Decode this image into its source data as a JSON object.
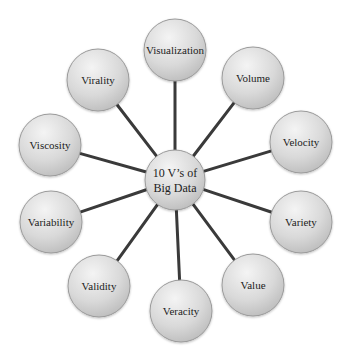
{
  "diagram": {
    "type": "hub-and-spoke",
    "hub": {
      "line1": "10 V’s of",
      "line2": "Big Data",
      "cx": 175,
      "cy": 180,
      "r": 30
    },
    "nodes": [
      {
        "id": "visualization",
        "label": "Visualization",
        "cx": 175,
        "cy": 50,
        "r": 31
      },
      {
        "id": "volume",
        "label": "Volume",
        "cx": 253,
        "cy": 78,
        "r": 31
      },
      {
        "id": "velocity",
        "label": "Velocity",
        "cx": 301,
        "cy": 142,
        "r": 31
      },
      {
        "id": "variety",
        "label": "Variety",
        "cx": 301,
        "cy": 222,
        "r": 31
      },
      {
        "id": "value",
        "label": "Value",
        "cx": 253,
        "cy": 285,
        "r": 31
      },
      {
        "id": "veracity",
        "label": "Veracity",
        "cx": 181,
        "cy": 311,
        "r": 31
      },
      {
        "id": "validity",
        "label": "Validity",
        "cx": 99,
        "cy": 286,
        "r": 31
      },
      {
        "id": "variability",
        "label": "Variability",
        "cx": 51,
        "cy": 222,
        "r": 31
      },
      {
        "id": "viscosity",
        "label": "Viscosity",
        "cx": 50,
        "cy": 145,
        "r": 31
      },
      {
        "id": "virality",
        "label": "Virality",
        "cx": 98,
        "cy": 80,
        "r": 31
      }
    ],
    "colors": {
      "background": "#ffffff",
      "spoke": "#3a3a3a",
      "node_fill_light": "#f2f2f2",
      "node_fill_dark": "#bdbdbd",
      "node_stroke": "#9a9a9a",
      "text": "#222222"
    }
  }
}
